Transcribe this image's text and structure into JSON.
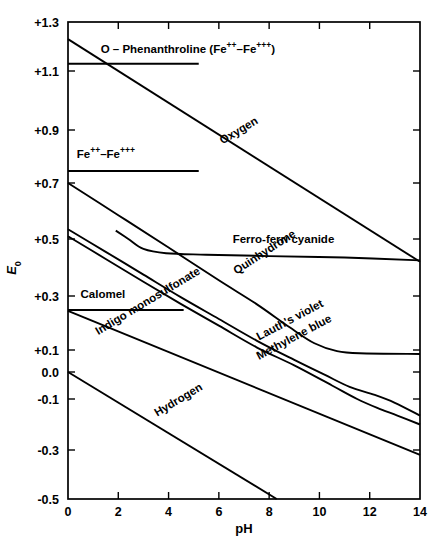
{
  "chart_data": {
    "type": "line",
    "title": "",
    "xlabel": "pH",
    "ylabel": "E₀",
    "xlim": [
      0,
      14
    ],
    "ylim": [
      -0.5,
      1.3
    ],
    "grid": false,
    "legend": "inline-labels",
    "xticks": [
      0,
      2,
      4,
      6,
      8,
      10,
      12,
      14
    ],
    "xticklabels": [
      "0",
      "2",
      "4",
      "6",
      "8",
      "10",
      "12",
      "14"
    ],
    "yticks": [
      1.3,
      1.1,
      0.9,
      0.7,
      0.5,
      0.3,
      0.1,
      0.0,
      -0.1,
      -0.3,
      -0.5
    ],
    "yticklabels": [
      "+1.3",
      "+1.1",
      "+0.9",
      "+0.7",
      "+0.5",
      "+0.3",
      "+0.1",
      "0.0",
      "-0.1",
      "-0.3",
      "-0.5"
    ],
    "series": [
      {
        "name": "Oxygen",
        "label": "Oxygen",
        "label_rotation": -31,
        "points": [
          [
            0,
            1.23
          ],
          [
            14,
            0.42
          ]
        ]
      },
      {
        "name": "O-Phenanthroline (Fe++-Fe+++)",
        "label": "O – Phenanthroline (Fe",
        "label_sup1": "++",
        "label_mid": "–Fe",
        "label_sup2": "+++",
        "label_end": ")",
        "label_rotation": 0,
        "points": [
          [
            0,
            1.13
          ],
          [
            5.2,
            1.13
          ]
        ]
      },
      {
        "name": "Fe++-Fe+++",
        "label": "Fe",
        "label_sup1": "++",
        "label_mid": "–Fe",
        "label_sup2": "+++",
        "label_end": "",
        "label_rotation": 0,
        "points": [
          [
            0,
            0.745
          ],
          [
            5.2,
            0.745
          ]
        ]
      },
      {
        "name": "Ferro-ferri cyanide",
        "label": "Ferro-ferri cyanide",
        "label_rotation": 0,
        "points": [
          [
            1.9,
            0.53
          ],
          [
            2.4,
            0.5
          ],
          [
            3.0,
            0.465
          ],
          [
            3.9,
            0.45
          ],
          [
            5.5,
            0.445
          ],
          [
            8.0,
            0.44
          ],
          [
            11.0,
            0.435
          ],
          [
            14,
            0.425
          ]
        ]
      },
      {
        "name": "Quinhydrone",
        "label": "Quinhydrone",
        "label_rotation": -33,
        "points": [
          [
            0,
            0.7
          ],
          [
            2.0,
            0.585
          ],
          [
            4.0,
            0.47
          ],
          [
            6.0,
            0.355
          ],
          [
            7.5,
            0.27
          ],
          [
            8.8,
            0.185
          ],
          [
            9.8,
            0.125
          ],
          [
            10.7,
            0.095
          ],
          [
            11.6,
            0.085
          ],
          [
            14,
            0.082
          ]
        ]
      },
      {
        "name": "Lauth's violet",
        "label": "Lauth's violet",
        "label_rotation": -28,
        "points": [
          [
            0,
            0.535
          ],
          [
            1.5,
            0.455
          ],
          [
            3.0,
            0.375
          ],
          [
            4.5,
            0.295
          ],
          [
            6.0,
            0.215
          ],
          [
            7.5,
            0.135
          ],
          [
            9.0,
            0.055
          ],
          [
            10.2,
            -0.01
          ],
          [
            11.2,
            -0.055
          ],
          [
            12.2,
            -0.085
          ],
          [
            13.0,
            -0.115
          ],
          [
            14,
            -0.165
          ]
        ]
      },
      {
        "name": "Methylene blue",
        "label": "Methylene blue",
        "label_rotation": -28,
        "points": [
          [
            0,
            0.51
          ],
          [
            1.5,
            0.43
          ],
          [
            3.0,
            0.35
          ],
          [
            4.5,
            0.27
          ],
          [
            6.0,
            0.19
          ],
          [
            7.5,
            0.11
          ],
          [
            9.0,
            0.03
          ],
          [
            10.5,
            -0.05
          ],
          [
            11.5,
            -0.1
          ],
          [
            12.3,
            -0.135
          ],
          [
            13.1,
            -0.165
          ],
          [
            14,
            -0.2
          ]
        ]
      },
      {
        "name": "Calomel",
        "label": "Calomel",
        "label_rotation": 0,
        "points": [
          [
            0,
            0.248
          ],
          [
            4.6,
            0.248
          ]
        ]
      },
      {
        "name": "Indigo monosulfonate",
        "label": "Indigo monosulfonate",
        "label_rotation": -31,
        "points": [
          [
            0,
            0.245
          ],
          [
            14,
            -0.32
          ]
        ]
      },
      {
        "name": "Hydrogen",
        "label": "Hydrogen",
        "label_rotation": -31,
        "points": [
          [
            0,
            0.0
          ],
          [
            8.3,
            -0.5
          ]
        ]
      }
    ]
  },
  "axes": {
    "x_title": "pH",
    "y_title": "E",
    "y_title_sub": "0"
  }
}
